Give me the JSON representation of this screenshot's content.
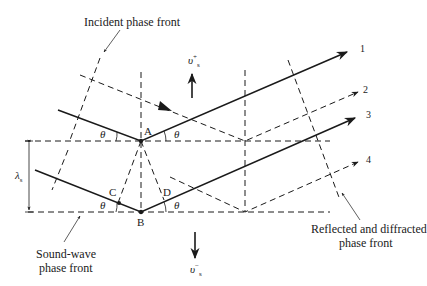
{
  "figure": {
    "labels": {
      "incident_front": "Incident phase front",
      "sound_front_line1": "Sound-wave",
      "sound_front_line2": "phase front",
      "reflected_front_line1": "Reflected and diffracted",
      "reflected_front_line2": "phase front",
      "point_a": "A",
      "point_b": "B",
      "point_c": "C",
      "point_d": "D",
      "ray_1": "1",
      "ray_2": "2",
      "ray_3": "3",
      "ray_4": "4",
      "theta": "θ",
      "wavelength_symbol": "λ",
      "wavelength_sub": "s",
      "velocity_up_symbol": "υ",
      "velocity_up_sub": "s",
      "velocity_up_sup": "+",
      "velocity_down_symbol": "υ",
      "velocity_down_sub": "s",
      "velocity_down_sup": "−"
    },
    "colors": {
      "stroke": "#1a1a1a",
      "background": "#ffffff"
    }
  }
}
